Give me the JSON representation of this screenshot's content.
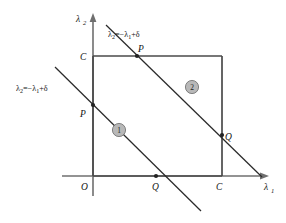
{
  "figure": {
    "axes": {
      "x_label_base": "λ",
      "x_label_sub": "1",
      "y_label_base": "λ",
      "y_label_sub": "2",
      "origin_label": "O"
    },
    "corner_labels": {
      "x_axis_C": "C",
      "y_axis_C": "C"
    },
    "constraint_lines": [
      {
        "id": "line-1",
        "label_base": "λ",
        "label_sub": "2",
        "label_rest": "=−λ",
        "label_sub2": "1",
        "label_tail": "+δ",
        "label_full": "λ₂=−λ₁+δ",
        "region_number": "1",
        "intersections": [
          "P",
          "Q"
        ]
      },
      {
        "id": "line-2",
        "label_base": "λ",
        "label_sub": "2",
        "label_rest": "=−λ",
        "label_sub2": "1",
        "label_tail": "+δ",
        "label_full": "λ₂=−λ₁+δ",
        "region_number": "2",
        "intersections": [
          "P",
          "Q"
        ]
      }
    ],
    "point_labels": {
      "p_lower": "P",
      "p_upper": "P",
      "q_lower": "Q",
      "q_upper": "Q"
    },
    "region_badges": [
      {
        "number": "1"
      },
      {
        "number": "2"
      }
    ],
    "colors": {
      "axis": "#6f6f6f",
      "square": "#4a4a4a",
      "line": "#2a2a2a",
      "badge_fill": "#b8b8b8",
      "badge_stroke": "#5a5a5a",
      "background": "#ffffff"
    }
  }
}
